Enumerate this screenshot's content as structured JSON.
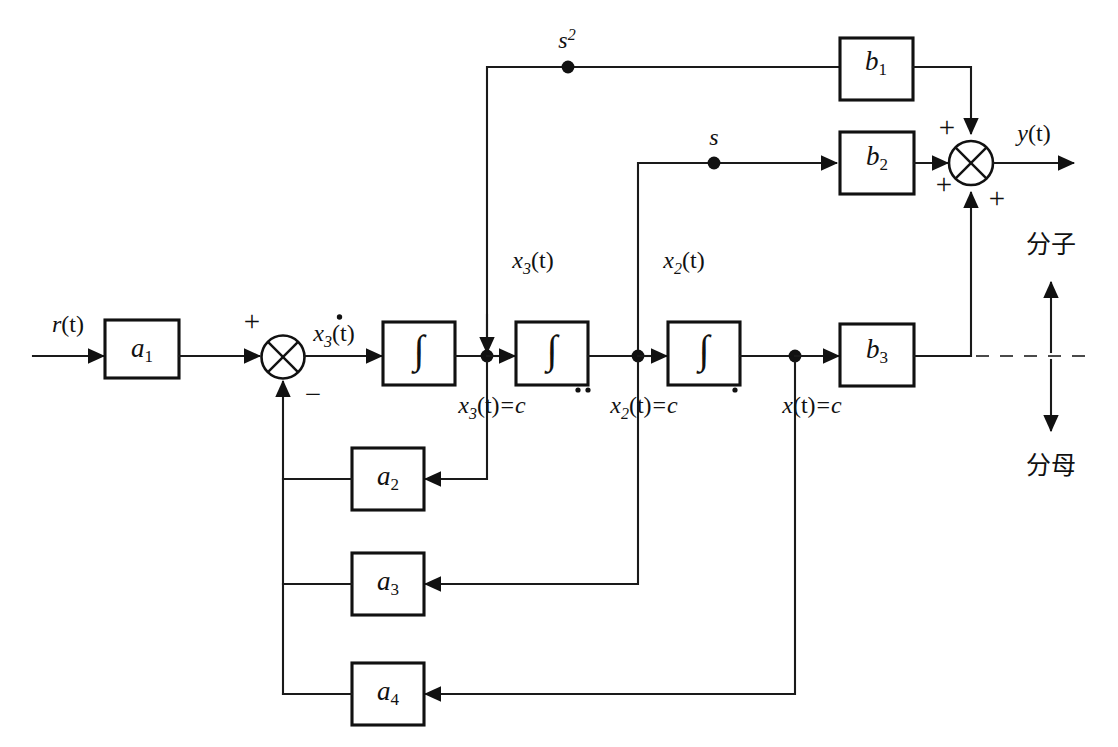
{
  "diagram": {
    "kind": "state-variable-block-diagram",
    "input_signal": "r(t)",
    "output_signal": "y(t)",
    "gain_blocks": [
      {
        "id": "a1",
        "base": "a",
        "sub": "1",
        "role": "input-gain"
      },
      {
        "id": "a2",
        "base": "a",
        "sub": "2",
        "role": "feedback-gain"
      },
      {
        "id": "a3",
        "base": "a",
        "sub": "3",
        "role": "feedback-gain"
      },
      {
        "id": "a4",
        "base": "a",
        "sub": "4",
        "role": "feedback-gain"
      },
      {
        "id": "b1",
        "base": "b",
        "sub": "1",
        "role": "feedforward-gain"
      },
      {
        "id": "b2",
        "base": "b",
        "sub": "2",
        "role": "feedforward-gain"
      },
      {
        "id": "b3",
        "base": "b",
        "sub": "3",
        "role": "feedforward-gain"
      }
    ],
    "integrators": [
      {
        "id": "int1",
        "glyph": "∫"
      },
      {
        "id": "int2",
        "glyph": "∫"
      },
      {
        "id": "int3",
        "glyph": "∫"
      }
    ],
    "summers": [
      {
        "id": "input-summer",
        "signs": [
          {
            "label": "+",
            "position": "top-left"
          },
          {
            "label": "−",
            "position": "bottom-right"
          }
        ]
      },
      {
        "id": "output-summer",
        "signs": [
          {
            "label": "+",
            "position": "top-left"
          },
          {
            "label": "+",
            "position": "bottom-left"
          },
          {
            "label": "+",
            "position": "bottom-right"
          }
        ]
      }
    ],
    "signal_labels": [
      {
        "id": "input",
        "base": "r",
        "paren": "(t)",
        "sub": ""
      },
      {
        "id": "x3dot",
        "base": "x",
        "paren": "(t)",
        "sub": "3",
        "dot": true
      },
      {
        "id": "x3-vert",
        "base": "x",
        "paren": "(t)",
        "sub": "3"
      },
      {
        "id": "x2-vert",
        "base": "x",
        "paren": "(t)",
        "sub": "2"
      },
      {
        "id": "output",
        "base": "y",
        "paren": "(t)",
        "sub": ""
      }
    ],
    "laplace_labels": [
      {
        "id": "s-squared",
        "base": "s",
        "sup": "2"
      },
      {
        "id": "s-first",
        "base": "s",
        "sup": ""
      }
    ],
    "state_equations": [
      {
        "id": "eq-x3",
        "base": "x",
        "sub": "3",
        "paren": "(t)",
        "eq": "=",
        "rhs": "c",
        "dots": 2
      },
      {
        "id": "eq-x2",
        "base": "x",
        "sub": "2",
        "paren": "(t)",
        "eq": "=",
        "rhs": "c",
        "dots": 1
      },
      {
        "id": "eq-x",
        "base": "x",
        "sub": "",
        "paren": "(t)",
        "eq": "=",
        "rhs": "c",
        "dots": 0
      }
    ],
    "partition": {
      "numerator_label": "分子",
      "denominator_label": "分母",
      "divider_style": "dashed"
    },
    "colors": {
      "line": "#1a1a1a",
      "dashed_line": "#4a4a4a",
      "block_stroke": "#111111",
      "block_fill": "#ffffff",
      "text": "#111111",
      "background": "#ffffff"
    }
  }
}
